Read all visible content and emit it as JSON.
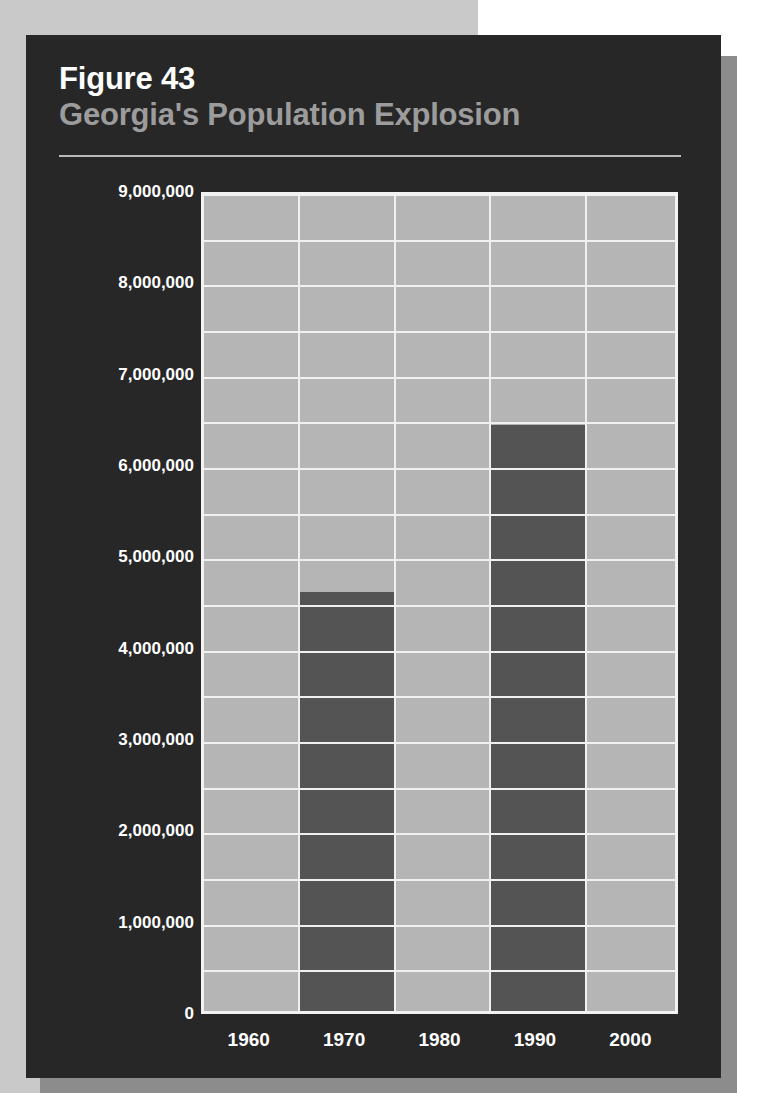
{
  "figure": {
    "number_label": "Figure 43",
    "title": "Georgia's Population Explosion"
  },
  "colors": {
    "panel_background": "#272727",
    "page_background_left": "#c9c9c9",
    "page_background_right": "#ffffff",
    "panel_shadow": "#8c8c8c",
    "plot_background": "#b5b5b5",
    "gridline": "#f0f0f0",
    "bar_fill": "#545454",
    "figure_number_text": "#ffffff",
    "figure_title_text": "#9c9c9c",
    "axis_label_text": "#ffffff",
    "title_rule": "#b9b9b9"
  },
  "chart_data": {
    "type": "bar",
    "title": "Georgia's Population Explosion",
    "subtitle": "Figure 43",
    "xlabel": "",
    "ylabel": "",
    "categories": [
      "1960",
      "1970",
      "1980",
      "1990",
      "2000"
    ],
    "values": [
      null,
      4590000,
      null,
      6420000,
      null
    ],
    "series": [
      {
        "name": "Georgia population",
        "values": [
          null,
          4590000,
          null,
          6420000,
          null
        ]
      }
    ],
    "ylim": [
      0,
      9000000
    ],
    "y_tick_step": 1000000,
    "y_gridline_step": 500000,
    "y_tick_labels": [
      "9,000,000",
      "8,000,000",
      "7,000,000",
      "6,000,000",
      "5,000,000",
      "4,000,000",
      "3,000,000",
      "2,000,000",
      "1,000,000",
      "0"
    ],
    "y_tick_values": [
      9000000,
      8000000,
      7000000,
      6000000,
      5000000,
      4000000,
      3000000,
      2000000,
      1000000,
      0
    ],
    "x_tick_labels": [
      "1960",
      "1970",
      "1980",
      "1990",
      "2000"
    ],
    "grid": true,
    "grid_orientation": "both",
    "legend": false,
    "legend_position": "none",
    "annotations": []
  }
}
